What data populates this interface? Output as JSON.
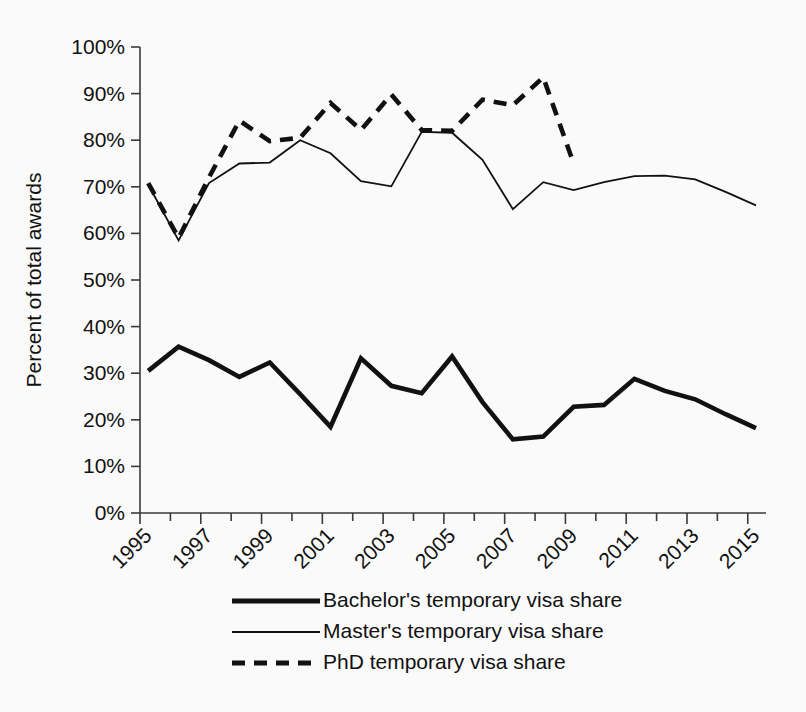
{
  "chart_data": {
    "type": "line",
    "title": "",
    "xlabel": "",
    "ylabel": "Percent of total awards",
    "ylim": [
      0,
      100
    ],
    "xlim": [
      1995,
      2015
    ],
    "grid": false,
    "legend_position": "bottom",
    "y_ticks": [
      "0%",
      "10%",
      "20%",
      "30%",
      "40%",
      "50%",
      "60%",
      "70%",
      "80%",
      "90%",
      "100%"
    ],
    "y_tick_values": [
      0,
      10,
      20,
      30,
      40,
      50,
      60,
      70,
      80,
      90,
      100
    ],
    "x_ticks": [
      "1995",
      "1997",
      "1999",
      "2001",
      "2003",
      "2005",
      "2007",
      "2009",
      "2011",
      "2013",
      "2015"
    ],
    "x_tick_values": [
      1995,
      1997,
      1999,
      2001,
      2003,
      2005,
      2007,
      2009,
      2011,
      2013,
      2015
    ],
    "x_minor_tick_values": [
      1996,
      1998,
      2000,
      2002,
      2004,
      2006,
      2008,
      2010,
      2012,
      2014
    ],
    "x": [
      1995,
      1996,
      1997,
      1998,
      1999,
      2000,
      2001,
      2002,
      2003,
      2004,
      2005,
      2006,
      2007,
      2008,
      2009,
      2010,
      2011,
      2012,
      2013,
      2014,
      2015
    ],
    "series": [
      {
        "name": "Bachelor's temporary visa share",
        "style": "thick-solid",
        "values": [
          30.5,
          35.7,
          32.8,
          29.2,
          32.3,
          25.5,
          18.5,
          33.2,
          27.3,
          25.7,
          33.6,
          23.8,
          15.8,
          16.4,
          22.8,
          23.2,
          28.8,
          26.2,
          24.4,
          21.2,
          18.2
        ]
      },
      {
        "name": "Master's temporary visa share",
        "style": "thin-solid",
        "values": [
          70.5,
          58.5,
          70.8,
          75.0,
          75.2,
          80.0,
          77.2,
          71.2,
          70.1,
          81.8,
          81.6,
          75.8,
          65.2,
          71.0,
          69.3,
          71.0,
          72.3,
          72.4,
          71.6,
          68.9,
          66.0
        ]
      },
      {
        "name": "PhD temporary visa share",
        "style": "dashed",
        "values": [
          70.8,
          59.0,
          72.0,
          84.2,
          79.8,
          80.5,
          88.0,
          82.2,
          89.8,
          82.2,
          82.0,
          88.7,
          87.5,
          93.5,
          75.0,
          null,
          null,
          null,
          null,
          null,
          null
        ]
      }
    ]
  },
  "legend": {
    "items": [
      {
        "label": "Bachelor's temporary visa share",
        "style": "thick-solid"
      },
      {
        "label": "Master's temporary visa share",
        "style": "thin-solid"
      },
      {
        "label": "PhD temporary visa share",
        "style": "dashed"
      }
    ]
  },
  "colors": {
    "line": "#111111",
    "axis": "#3a3a3a",
    "background": "#fafafa"
  }
}
